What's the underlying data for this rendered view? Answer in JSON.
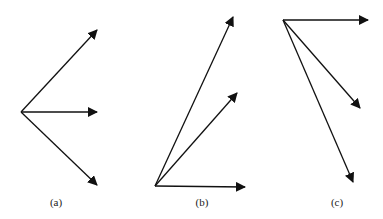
{
  "panels": [
    {
      "label": "(a)",
      "label_pos": [
        56,
        206
      ],
      "origin": [
        21,
        112
      ],
      "arrows": [
        [
          97,
          30
        ],
        [
          97,
          112
        ],
        [
          97,
          185
        ]
      ]
    },
    {
      "label": "(b)",
      "label_pos": [
        202,
        206
      ],
      "origin": [
        155,
        186
      ],
      "arrows": [
        [
          233,
          17
        ],
        [
          237,
          93
        ],
        [
          245,
          187
        ]
      ]
    },
    {
      "label": "(c)",
      "label_pos": [
        337,
        206
      ],
      "origin": [
        283,
        20
      ],
      "arrows": [
        [
          368,
          20
        ],
        [
          360,
          108
        ],
        [
          353,
          182
        ]
      ]
    }
  ],
  "colors": {
    "stroke": "#111111",
    "background": "#ffffff"
  }
}
